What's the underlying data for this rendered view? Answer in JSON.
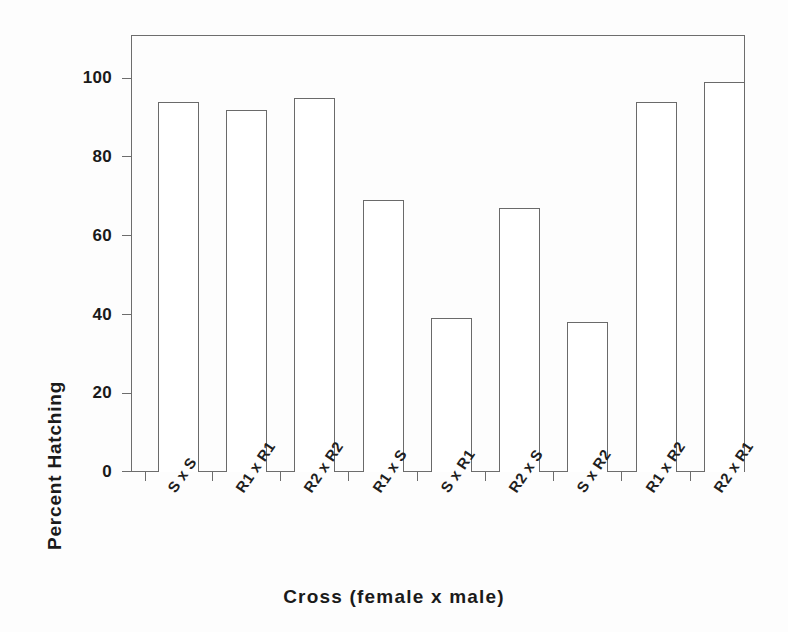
{
  "chart_data": {
    "type": "bar",
    "title": "",
    "xlabel": "Cross (female x male)",
    "ylabel": "Percent Hatching",
    "categories": [
      "S x S",
      "R1 x R1",
      "R2 x R2",
      "R1 x S",
      "S x R1",
      "R2 x S",
      "S x R2",
      "R1 x R2",
      "R2 x R1"
    ],
    "values": [
      94,
      92,
      95,
      69,
      39,
      67,
      38,
      94,
      99
    ],
    "ylim": [
      0,
      111
    ],
    "ytick_values": [
      0,
      20,
      40,
      60,
      80,
      100
    ],
    "ytick_labels": [
      "0",
      "20",
      "40",
      "60",
      "80",
      "100"
    ],
    "grid": false,
    "legend": null,
    "bar_fill": "#ffffff",
    "bar_edge_color": "#6a6a6a",
    "axis_color": "#6d6d6d",
    "text_color": "#1a1a1a",
    "background": "#fdfdfd"
  },
  "axes": {
    "y_title": "Percent Hatching",
    "x_title": "Cross (female x male)"
  }
}
